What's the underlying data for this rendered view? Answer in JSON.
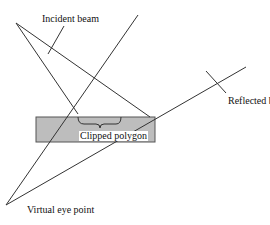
{
  "labels": {
    "incident": "Incident beam",
    "reflected": "Reflected beam",
    "clipped": "Clipped polygon",
    "eye": "Virtual eye point"
  },
  "colors": {
    "line": "#333333",
    "surface_fill": "#bdbdbd",
    "surface_stroke": "#555555"
  }
}
